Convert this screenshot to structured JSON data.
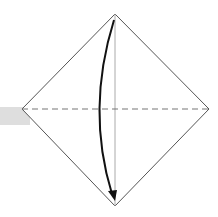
{
  "diagram": {
    "type": "origami-fold-step",
    "colors": {
      "outline": "#555555",
      "fold_line": "#777777",
      "center_crease": "#aaaaaa",
      "arrow": "#111111",
      "shaded_tab": "#dedede"
    },
    "elements": {
      "square": {
        "top": [
          115,
          14
        ],
        "right": [
          209,
          109
        ],
        "bottom": [
          115,
          206
        ],
        "left": [
          22,
          109
        ]
      },
      "valley_fold_line": {
        "from": [
          22,
          109
        ],
        "to": [
          209,
          109
        ],
        "style": "dashed"
      },
      "center_crease": {
        "from": [
          115,
          14
        ],
        "to": [
          115,
          206
        ]
      },
      "fold_arrow": {
        "from": [
          114,
          20
        ],
        "to": [
          114,
          200
        ],
        "direction": "down"
      },
      "shaded_tab": {
        "x": 0,
        "y": 107,
        "w": 30,
        "h": 18
      }
    }
  }
}
